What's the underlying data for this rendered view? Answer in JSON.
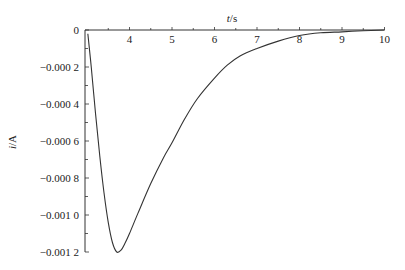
{
  "chart_data": {
    "type": "line",
    "title": "",
    "xlabel": "t/s",
    "ylabel": "i/A",
    "xlim": [
      3,
      10
    ],
    "ylim": [
      -0.0012,
      0
    ],
    "x_ticks": [
      4,
      5,
      6,
      7,
      8,
      9,
      10
    ],
    "x_tick_labels": [
      "4",
      "5",
      "6",
      "7",
      "8",
      "9",
      "10"
    ],
    "y_ticks": [
      0,
      -0.0002,
      -0.0004,
      -0.0006,
      -0.0008,
      -0.001,
      -0.0012
    ],
    "y_tick_labels": [
      "0",
      "−0.000 2",
      "−0.000 4",
      "−0.000 6",
      "−0.000 8",
      "−0.001 0",
      "−0.001 2"
    ],
    "grid": false,
    "legend": null,
    "x_axis_position": "top",
    "series": [
      {
        "name": "i(t)",
        "color": "#333333",
        "x": [
          3.02,
          3.1,
          3.2,
          3.3,
          3.4,
          3.5,
          3.6,
          3.7,
          3.8,
          3.9,
          4.0,
          4.2,
          4.5,
          4.8,
          5.0,
          5.3,
          5.6,
          6.0,
          6.3,
          6.6,
          7.0,
          7.5,
          8.0,
          8.5,
          9.0,
          9.5,
          10.0
        ],
        "y": [
          -2e-05,
          -0.0002,
          -0.00045,
          -0.00068,
          -0.00088,
          -0.00104,
          -0.00115,
          -0.0012,
          -0.00119,
          -0.00115,
          -0.0011,
          -0.00099,
          -0.00083,
          -0.00069,
          -0.00061,
          -0.00048,
          -0.00037,
          -0.00026,
          -0.00019,
          -0.00014,
          -0.0001,
          -6e-05,
          -3e-05,
          -1.5e-05,
          -1e-05,
          -4e-06,
          0
        ]
      }
    ]
  }
}
